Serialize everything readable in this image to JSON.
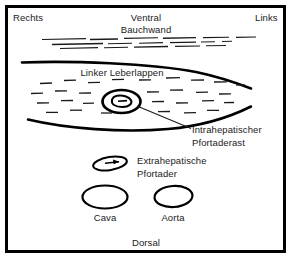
{
  "diagram": {
    "frame_color": "#000000",
    "background_color": "#ffffff",
    "ink_color": "#1a1a1a"
  },
  "orientation": {
    "right": "Rechts",
    "left": "Links",
    "top": "Ventral",
    "bottom": "Dorsal"
  },
  "structures": {
    "abdominal_wall": "Bauchwand",
    "liver_lobe": "Linker Leberlappen",
    "intrahepatic_branch_line1": "Intrahepatischer",
    "intrahepatic_branch_line2": "Pfortaderast",
    "extrahepatic_vein_line1": "Extrahepatische",
    "extrahepatic_vein_line2": "Pfortader",
    "vena_cava": "Cava",
    "aorta": "Aorta"
  }
}
